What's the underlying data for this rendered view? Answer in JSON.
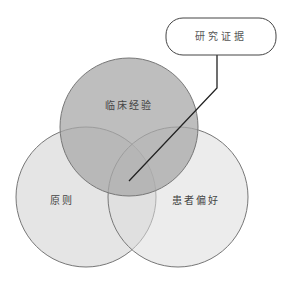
{
  "diagram": {
    "type": "venn",
    "circles": [
      {
        "id": "clinical",
        "label": "临床经验",
        "cx": 129,
        "cy": 127,
        "r": 69,
        "fill": "#a8a8a8",
        "opacity": 0.75
      },
      {
        "id": "guidelines",
        "label": "原则",
        "cx": 86,
        "cy": 197,
        "r": 70,
        "fill": "#d4d4d4",
        "opacity": 0.6
      },
      {
        "id": "patient",
        "label": "患者偏好",
        "cx": 178,
        "cy": 197,
        "r": 70,
        "fill": "#dcdcdc",
        "opacity": 0.55
      }
    ],
    "callout": {
      "label": "研究证据",
      "box": {
        "x": 166,
        "y": 18,
        "w": 110,
        "h": 37,
        "rx": 17
      },
      "pointer": [
        [
          217,
          55
        ],
        [
          217,
          88
        ],
        [
          129,
          181
        ]
      ]
    },
    "stroke_color": "#777777",
    "pointer_color": "#222222"
  }
}
